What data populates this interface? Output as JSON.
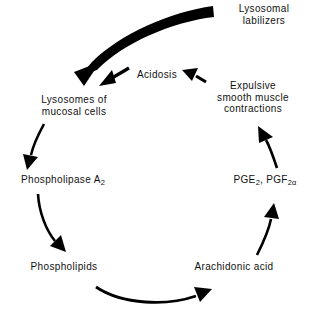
{
  "diagram": {
    "background_color": "#ffffff",
    "ink_color": "#000000",
    "nodes": {
      "lysosomal_labilizers": "Lysosomal\nlabilizers",
      "acidosis": "Acidosis",
      "expulsive_contractions": "Expulsive\nsmooth muscle\ncontractions",
      "lysosomes_mucosal_cells": "Lysosomes of\nmucosal cells",
      "phospholipase_a2_name": "Phospholipase  A",
      "phospholipase_a2_subscript": "2",
      "pge2_prefix": "PGE",
      "pge2_subscript": "2",
      "pgf2a_separator": ", PGF",
      "pgf2a_subscript": "2α",
      "phospholipids": "Phospholipids",
      "arachidonic_acid": "Arachidonic  acid"
    },
    "arrows": [
      {
        "name": "labilizers-to-lysosomes",
        "style": "thick-tapered-curve",
        "from": "lysosomal_labilizers",
        "to": "lysosomes_mucosal_cells"
      },
      {
        "name": "acidosis-to-lysosomes",
        "style": "short-straight",
        "from": "acidosis",
        "to": "lysosomes_mucosal_cells"
      },
      {
        "name": "contractions-to-acidosis",
        "style": "short-straight",
        "from": "expulsive_contractions",
        "to": "acidosis"
      },
      {
        "name": "lysosomes-to-phospholipase",
        "style": "curve",
        "from": "lysosomes_mucosal_cells",
        "to": "phospholipase_a2"
      },
      {
        "name": "phospholipase-to-phospholipids",
        "style": "curve",
        "from": "phospholipase_a2",
        "to": "phospholipids"
      },
      {
        "name": "phospholipids-to-arachidonic",
        "style": "curve",
        "from": "phospholipids",
        "to": "arachidonic_acid"
      },
      {
        "name": "arachidonic-to-prostaglandins",
        "style": "curve",
        "from": "arachidonic_acid",
        "to": "pge2_pgf2a"
      },
      {
        "name": "prostaglandins-to-contractions",
        "style": "curve",
        "from": "pge2_pgf2a",
        "to": "expulsive_contractions"
      }
    ]
  }
}
